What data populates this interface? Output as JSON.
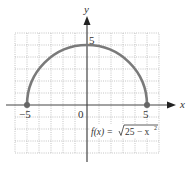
{
  "chart_data": {
    "type": "line",
    "title": "",
    "function_label": "f(x) = √(25 − x²)",
    "xlabel": "x",
    "ylabel": "y",
    "xlim": [
      -6,
      6
    ],
    "ylim": [
      -4,
      6
    ],
    "grid": true,
    "x_tick_labels": [
      "−5",
      "0",
      "5"
    ],
    "y_tick_labels": [
      "5"
    ],
    "series": [
      {
        "name": "f(x) = sqrt(25 - x^2)",
        "x": [
          -5,
          -4,
          -3,
          -2,
          -1,
          0,
          1,
          2,
          3,
          4,
          5
        ],
        "y": [
          0,
          3,
          4,
          4.58,
          4.9,
          5,
          4.9,
          4.58,
          4,
          3,
          0
        ]
      }
    ],
    "endpoints": [
      [
        -5,
        0
      ],
      [
        5,
        0
      ]
    ],
    "colors": {
      "curve": "#7a7a7a",
      "axis": "#444444",
      "grid": "#b5b5b5"
    }
  },
  "labels": {
    "x_axis": "x",
    "y_axis": "y",
    "tick_neg5": "−5",
    "tick_0": "0",
    "tick_5": "5",
    "tick_y5": "5",
    "fx_prefix": "f(x) = ",
    "fx_radicand": "25 − x",
    "fx_exp": "2"
  }
}
